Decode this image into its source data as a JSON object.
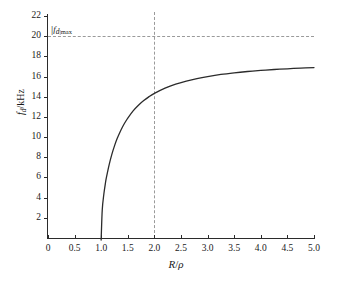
{
  "chart_data": {
    "type": "line",
    "title": "",
    "xlabel": "R/ρ",
    "ylabel": "fₐ/kHz",
    "ylabel_main": "f",
    "ylabel_sub": "d",
    "ylabel_unit": "/kHz",
    "xlabel_num": "R",
    "xlabel_den": "ρ",
    "xlim": [
      0,
      5.0
    ],
    "ylim": [
      0,
      22
    ],
    "grid": false,
    "legend": null,
    "x_ticks": [
      0,
      0.5,
      1.0,
      1.5,
      2.0,
      2.5,
      3.0,
      3.5,
      4.0,
      4.5,
      5.0
    ],
    "x_tick_labels": [
      "0",
      "0.5",
      "1.0",
      "1.5",
      "2.0",
      "2.5",
      "3.0",
      "3.5",
      "4.0",
      "4.5",
      "5.0"
    ],
    "y_ticks": [
      2,
      4,
      6,
      8,
      10,
      12,
      14,
      16,
      18,
      20,
      22
    ],
    "y_tick_labels": [
      "2",
      "4",
      "6",
      "8",
      "10",
      "12",
      "14",
      "16",
      "18",
      "20",
      "22"
    ],
    "series": [
      {
        "name": "fd",
        "color": "#2b2b2b",
        "linewidth": 1.3,
        "x": [
          1.0,
          1.0,
          1.02,
          1.05,
          1.08,
          1.1,
          1.15,
          1.2,
          1.25,
          1.3,
          1.35,
          1.4,
          1.45,
          1.5,
          1.6,
          1.7,
          1.8,
          1.9,
          2.0,
          2.2,
          2.4,
          2.6,
          2.8,
          3.0,
          3.25,
          3.5,
          3.75,
          4.0,
          4.25,
          4.5,
          4.75,
          5.0
        ],
        "y": [
          0.0,
          0.0,
          2.8,
          4.36,
          5.46,
          6.05,
          7.28,
          8.29,
          9.13,
          9.85,
          10.46,
          11.0,
          11.47,
          11.89,
          12.6,
          13.16,
          13.62,
          14.01,
          14.33,
          14.85,
          15.25,
          15.55,
          15.8,
          16.0,
          16.21,
          16.37,
          16.5,
          16.61,
          16.7,
          16.77,
          16.84,
          16.89
        ]
      }
    ],
    "annotations": [
      {
        "name": "fd-max-level",
        "label": "|fₐ|max",
        "label_bar": "|",
        "label_main": "f",
        "label_sub": "d",
        "label_max": "|max",
        "type": "horizontal-dashed-line",
        "y_value": 20,
        "color": "#9a9a9a"
      },
      {
        "name": "reference-radius",
        "label": "",
        "type": "vertical-dashed-line",
        "x_value": 2.0,
        "color": "#9a9a9a"
      }
    ]
  },
  "caption": {
    "text": ""
  }
}
